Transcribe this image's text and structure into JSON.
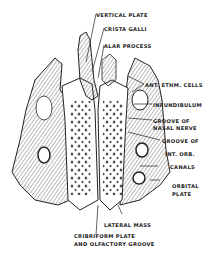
{
  "diagram": {
    "colors": {
      "ink": "#222222",
      "background": "#ffffff",
      "shade": "#8a8a8a"
    },
    "labels": [
      {
        "id": "vertical-plate",
        "text": "VERTICAL PLATE"
      },
      {
        "id": "crista-galli",
        "text": "CRISTA GALLI"
      },
      {
        "id": "alar-process",
        "text": "ALAR PROCESS"
      },
      {
        "id": "ant-ethm-cells",
        "text": "ANT. ETHM. CELLS"
      },
      {
        "id": "infundibulum",
        "text": "INFUNDIBULUM"
      },
      {
        "id": "groove-nasal-nerve-1",
        "text": "GROOVE OF"
      },
      {
        "id": "groove-nasal-nerve-2",
        "text": "NASAL NERVE"
      },
      {
        "id": "groove-int-orb-1",
        "text": "GROOVE OF"
      },
      {
        "id": "groove-int-orb-2",
        "text": "INT. ORB."
      },
      {
        "id": "canals",
        "text": "CANALS"
      },
      {
        "id": "orbital-plate-1",
        "text": "ORBITAL"
      },
      {
        "id": "orbital-plate-2",
        "text": "PLATE"
      },
      {
        "id": "lateral-mass",
        "text": "LATERAL MASS"
      },
      {
        "id": "cribriform-1",
        "text": "CRIBRIFORM PLATE"
      },
      {
        "id": "cribriform-2",
        "text": "AND OLFACTORY GROOVE"
      }
    ]
  }
}
